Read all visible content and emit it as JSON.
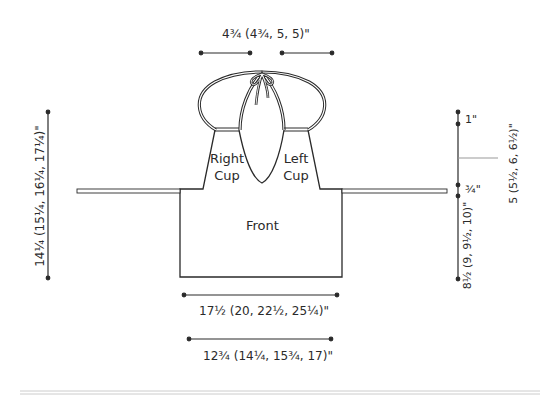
{
  "diagram": {
    "type": "schematic",
    "pieces": {
      "front_label": "Front",
      "right_cup_label": [
        "Right",
        "Cup"
      ],
      "left_cup_label": [
        "Left",
        "Cup"
      ]
    },
    "dimensions": {
      "strap_width": "4¾ (4¾, 5, 5)\"",
      "total_height": "14¼ (15¼, 16¼, 17¼)\"",
      "front_width": "17½ (20, 22½, 25¼)\"",
      "front_bottom_width": "12¾ (14¼, 15¾, 17)\"",
      "cup_top": "1\"",
      "cup_height": "5 (5½, 6, 6½)\"",
      "band": "¾\"",
      "body_height": "8½ (9, 9½, 10)\""
    },
    "colors": {
      "line": "#2a2a2a",
      "tie": "#888888",
      "rule": "#cccccc"
    }
  }
}
